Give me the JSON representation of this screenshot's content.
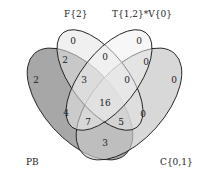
{
  "diagram": {
    "type": "venn-4",
    "sets": [
      {
        "id": "PB",
        "label": "PB",
        "color": "#8a8a8a"
      },
      {
        "id": "F",
        "label": "F{2}",
        "color": "#d8d8d8"
      },
      {
        "id": "T",
        "label": "T{1,2}*V{0}",
        "color": "#e6e6e6"
      },
      {
        "id": "C",
        "label": "C{0,1}",
        "color": "#bdbdbd"
      }
    ],
    "regions": {
      "F_only": "0",
      "T_only": "0",
      "PB_only": "2",
      "C_only": "0",
      "PB_F": "2",
      "F_T": "0",
      "T_C": "0",
      "PB_F_T": "3",
      "F_T_C": "0",
      "PB_C": "3",
      "PB_F_C": "4",
      "T_C_PB": "0",
      "all": "16",
      "PB_F_T_C_left": "7",
      "PB_F_T_C_right": "5",
      "T_C_PB_outer": "0"
    }
  }
}
